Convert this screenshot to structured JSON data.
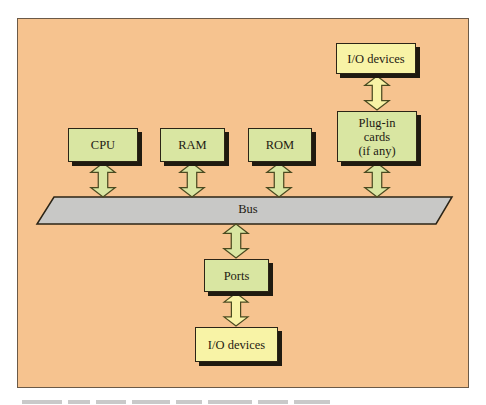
{
  "diagram": {
    "colors": {
      "panel": "#f6c38f",
      "component_box": "#d9e6a2",
      "device_box": "#f8f3a6",
      "bus": "#c8c8c6",
      "outline": "#2b2416"
    },
    "components": {
      "cpu": {
        "label": "CPU"
      },
      "ram": {
        "label": "RAM"
      },
      "rom": {
        "label": "ROM"
      },
      "plugin_cards": {
        "line1": "Plug-in",
        "line2": "cards",
        "line3": "(if any)"
      },
      "ports": {
        "label": "Ports"
      }
    },
    "devices": {
      "io_top": {
        "label": "I/O devices"
      },
      "io_bottom": {
        "label": "I/O devices"
      }
    },
    "bus": {
      "label": "Bus"
    },
    "connections": [
      {
        "from": "CPU",
        "to": "Bus",
        "type": "bidirectional"
      },
      {
        "from": "RAM",
        "to": "Bus",
        "type": "bidirectional"
      },
      {
        "from": "ROM",
        "to": "Bus",
        "type": "bidirectional"
      },
      {
        "from": "Plug-in cards",
        "to": "Bus",
        "type": "bidirectional"
      },
      {
        "from": "I/O devices",
        "to": "Plug-in cards",
        "type": "bidirectional"
      },
      {
        "from": "Bus",
        "to": "Ports",
        "type": "bidirectional"
      },
      {
        "from": "Ports",
        "to": "I/O devices",
        "type": "bidirectional"
      }
    ]
  }
}
